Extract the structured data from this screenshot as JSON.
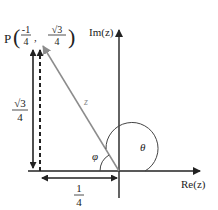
{
  "diagram": {
    "point": {
      "label": "P",
      "x_num": "-1",
      "x_den": "4",
      "y_num": "√3",
      "y_den": "4"
    },
    "axes": {
      "imag_label": "Im(z)",
      "real_label": "Re(z)"
    },
    "vector_label": "z",
    "angles": {
      "phi": "φ",
      "theta": "θ"
    },
    "height_label": {
      "num": "√3",
      "den": "4"
    },
    "width_label": {
      "num": "1",
      "den": "4"
    },
    "colors": {
      "axis": "#222222",
      "vector": "#8c8c8c",
      "text": "#222222"
    }
  }
}
